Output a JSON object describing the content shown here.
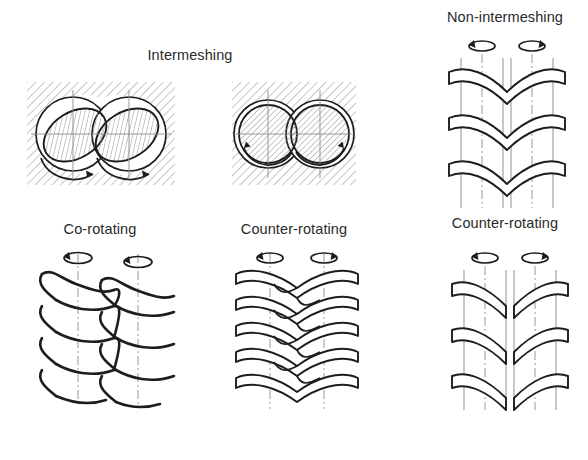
{
  "figure": {
    "title_intermeshing": "Intermeshing",
    "title_non_intermeshing": "Non-intermeshing",
    "background_color": "#ffffff",
    "line_color": "#1d1d1d",
    "hatch_color": "#9a9a9a",
    "centerline_color": "#8d8d8d"
  },
  "groups": [
    {
      "id": "intermeshing",
      "heading": "Intermeshing",
      "items": [
        {
          "id": "intermeshing-co-rotating",
          "label": "Co-rotating",
          "cross_section": "two overlapping bores, tilted elliptical hatched screw cores",
          "rotation": "same direction",
          "arrow_left": "counter-clockwise",
          "arrow_right": "counter-clockwise"
        },
        {
          "id": "intermeshing-counter-rotating",
          "label": "Counter-rotating",
          "cross_section": "two tangent circular bores, circular hatched screw cores",
          "rotation": "opposite directions",
          "arrow_left": "clockwise",
          "arrow_right": "counter-clockwise"
        }
      ]
    },
    {
      "id": "non-intermeshing",
      "heading": "Non-intermeshing",
      "items": [
        {
          "id": "non-intermeshing-counter-rotating-top",
          "label": "Non-intermeshing",
          "rotation": "opposite directions"
        },
        {
          "id": "non-intermeshing-counter-rotating-bottom",
          "label": "Counter-rotating",
          "rotation": "opposite directions"
        }
      ]
    }
  ],
  "labels": {
    "intermeshing": "Intermeshing",
    "co_rotating": "Co-rotating",
    "counter_rotating_mid": "Counter-rotating",
    "non_intermeshing": "Non-intermeshing",
    "counter_rotating_right": "Counter-rotating"
  }
}
